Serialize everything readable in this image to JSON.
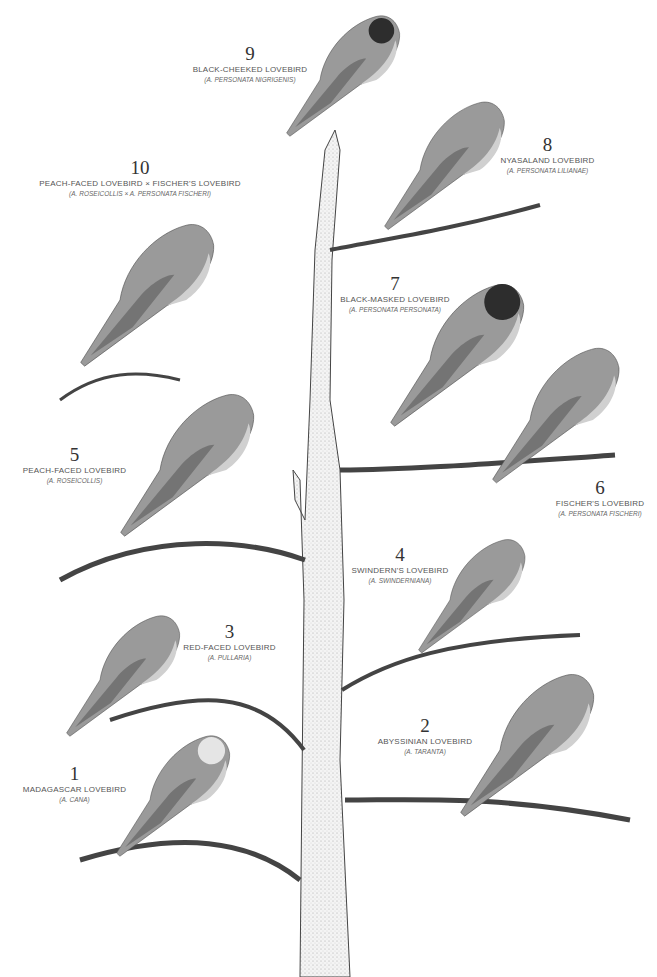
{
  "plate": {
    "header_fragment": "",
    "subject": "Lovebird species on a branching tree",
    "birds": [
      {
        "num": "1",
        "common": "MADAGASCAR LOVEBIRD",
        "latin": "(A. CANA)"
      },
      {
        "num": "2",
        "common": "ABYSSINIAN LOVEBIRD",
        "latin": "(A. TARANTA)"
      },
      {
        "num": "3",
        "common": "RED-FACED LOVEBIRD",
        "latin": "(A. PULLARIA)"
      },
      {
        "num": "4",
        "common": "SWINDERN'S LOVEBIRD",
        "latin": "(A. SWINDERNIANA)"
      },
      {
        "num": "5",
        "common": "PEACH-FACED LOVEBIRD",
        "latin": "(A. ROSEICOLLIS)"
      },
      {
        "num": "6",
        "common": "FISCHER'S LOVEBIRD",
        "latin": "(A. PERSONATA FISCHERI)"
      },
      {
        "num": "7",
        "common": "BLACK-MASKED LOVEBIRD",
        "latin": "(A. PERSONATA PERSONATA)"
      },
      {
        "num": "8",
        "common": "NYASALAND LOVEBIRD",
        "latin": "(A. PERSONATA LILIANAE)"
      },
      {
        "num": "9",
        "common": "BLACK-CHEEKED LOVEBIRD",
        "latin": "(A. PERSONATA NIGRIGENIS)"
      },
      {
        "num": "10",
        "common": "PEACH-FACED LOVEBIRD × FISCHER'S LOVEBIRD",
        "latin": "(A. ROSEICOLLIS × A. PERSONATA FISCHERI)"
      }
    ]
  },
  "colors": {
    "ink": "#333333",
    "tree": "#f2f2f2",
    "bird_body": "#9a9a9a",
    "bird_dark": "#3a3a3a",
    "bird_light": "#d8d8d8"
  }
}
